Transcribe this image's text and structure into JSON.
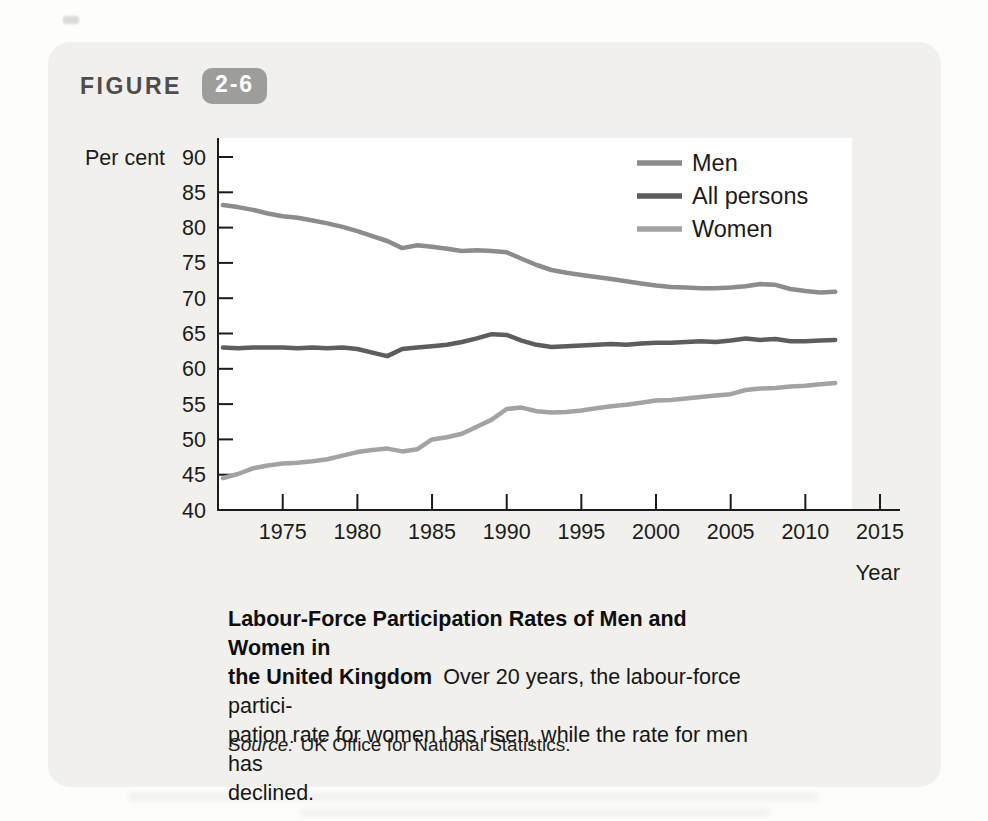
{
  "figure": {
    "label": "FIGURE",
    "number": "2-6"
  },
  "chart_data": {
    "type": "line",
    "x": [
      1971,
      1972,
      1973,
      1974,
      1975,
      1976,
      1977,
      1978,
      1979,
      1980,
      1981,
      1982,
      1983,
      1984,
      1985,
      1986,
      1987,
      1988,
      1989,
      1990,
      1991,
      1992,
      1993,
      1994,
      1995,
      1996,
      1997,
      1998,
      1999,
      2000,
      2001,
      2002,
      2003,
      2004,
      2005,
      2006,
      2007,
      2008,
      2009,
      2010,
      2011,
      2012
    ],
    "series": [
      {
        "name": "Men",
        "color": "#8c8c8c",
        "values": [
          83.2,
          82.9,
          82.5,
          82.0,
          81.6,
          81.4,
          81.0,
          80.6,
          80.1,
          79.5,
          78.8,
          78.1,
          77.1,
          77.5,
          77.3,
          77.0,
          76.7,
          76.8,
          76.7,
          76.5,
          75.6,
          74.7,
          74.0,
          73.6,
          73.3,
          73.0,
          72.7,
          72.4,
          72.1,
          71.8,
          71.6,
          71.5,
          71.4,
          71.4,
          71.5,
          71.7,
          72.0,
          71.9,
          71.3,
          71.0,
          70.8,
          70.9
        ]
      },
      {
        "name": "All persons",
        "color": "#5d5d5d",
        "values": [
          63.0,
          62.9,
          63.0,
          63.0,
          63.0,
          62.9,
          63.0,
          62.9,
          63.0,
          62.8,
          62.3,
          61.8,
          62.8,
          63.0,
          63.2,
          63.4,
          63.8,
          64.3,
          64.9,
          64.8,
          64.0,
          63.4,
          63.1,
          63.2,
          63.3,
          63.4,
          63.5,
          63.4,
          63.6,
          63.7,
          63.7,
          63.8,
          63.9,
          63.8,
          64.0,
          64.3,
          64.1,
          64.2,
          63.9,
          63.9,
          64.0,
          64.1
        ]
      },
      {
        "name": "Women",
        "color": "#a3a3a3",
        "values": [
          44.5,
          45.1,
          45.9,
          46.3,
          46.6,
          46.7,
          46.9,
          47.2,
          47.7,
          48.2,
          48.5,
          48.7,
          48.3,
          48.6,
          50.0,
          50.3,
          50.8,
          51.8,
          52.8,
          54.3,
          54.5,
          54.0,
          53.8,
          53.9,
          54.1,
          54.4,
          54.7,
          54.9,
          55.2,
          55.5,
          55.6,
          55.8,
          56.0,
          56.2,
          56.4,
          57.0,
          57.2,
          57.3,
          57.5,
          57.6,
          57.8,
          58.0
        ]
      }
    ],
    "ylabel": "Per cent",
    "xlabel": "Year",
    "ylim": [
      40,
      90
    ],
    "xlim": [
      1971,
      2015
    ],
    "yticks": [
      40,
      45,
      50,
      55,
      60,
      65,
      70,
      75,
      80,
      85,
      90
    ],
    "xticks": [
      1975,
      1980,
      1985,
      1990,
      1995,
      2000,
      2005,
      2010,
      2015
    ],
    "grid": false,
    "legend_position": "upper-right",
    "title": "Labour-Force Participation Rates of Men and Women in the United Kingdom"
  },
  "caption": {
    "line1_bold": "Labour-Force Participation Rates of Men and Women in",
    "line2_bold": "the United Kingdom",
    "line2_rest": "Over 20 years, the labour-force partici-",
    "line3": "pation rate for women has risen, while the rate for men has",
    "line4": "declined."
  },
  "source": {
    "label": "Source:",
    "text": "UK Office for National Statistics."
  },
  "ghost": {
    "line1": "Conclusion: From Economic",
    "line2": "to Economic Model"
  }
}
